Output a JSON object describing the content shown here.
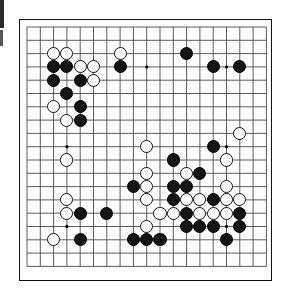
{
  "app": {
    "title": "Go Board Position",
    "board_size": 19,
    "colors": {
      "line": "#4a4a4a",
      "frame": "#111111",
      "black_stone": "#141414",
      "white_stone": "#ffffff",
      "white_stone_border": "#111111",
      "background": "#ffffff"
    }
  },
  "board": {
    "size": 19,
    "origin_x": 8.0,
    "origin_y": 8.0,
    "cell": 13.3,
    "stone_radius": 6.6,
    "star_points": [
      {
        "col": 4,
        "row": 4
      },
      {
        "col": 10,
        "row": 4
      },
      {
        "col": 16,
        "row": 4
      },
      {
        "col": 4,
        "row": 10
      },
      {
        "col": 10,
        "row": 10
      },
      {
        "col": 16,
        "row": 10
      },
      {
        "col": 4,
        "row": 16
      },
      {
        "col": 10,
        "row": 16
      },
      {
        "col": 16,
        "row": 16
      }
    ],
    "stones": [
      {
        "color": "white",
        "col": 3,
        "row": 3
      },
      {
        "color": "white",
        "col": 4,
        "row": 3
      },
      {
        "color": "white",
        "col": 8,
        "row": 3
      },
      {
        "color": "black",
        "col": 13,
        "row": 3
      },
      {
        "color": "black",
        "col": 3,
        "row": 4
      },
      {
        "color": "black",
        "col": 4,
        "row": 4
      },
      {
        "color": "white",
        "col": 5,
        "row": 4
      },
      {
        "color": "white",
        "col": 6,
        "row": 4
      },
      {
        "color": "black",
        "col": 8,
        "row": 4
      },
      {
        "color": "black",
        "col": 15,
        "row": 4
      },
      {
        "color": "black",
        "col": 17,
        "row": 4
      },
      {
        "color": "black",
        "col": 3,
        "row": 5
      },
      {
        "color": "black",
        "col": 5,
        "row": 5
      },
      {
        "color": "white",
        "col": 6,
        "row": 5
      },
      {
        "color": "black",
        "col": 4,
        "row": 6
      },
      {
        "color": "white",
        "col": 3,
        "row": 7
      },
      {
        "color": "black",
        "col": 5,
        "row": 7
      },
      {
        "color": "white",
        "col": 4,
        "row": 8
      },
      {
        "color": "black",
        "col": 5,
        "row": 8
      },
      {
        "color": "white",
        "col": 17,
        "row": 9
      },
      {
        "color": "white",
        "col": 10,
        "row": 10
      },
      {
        "color": "black",
        "col": 15,
        "row": 10
      },
      {
        "color": "white",
        "col": 4,
        "row": 11
      },
      {
        "color": "black",
        "col": 12,
        "row": 11
      },
      {
        "color": "white",
        "col": 16,
        "row": 11
      },
      {
        "color": "white",
        "col": 10,
        "row": 12
      },
      {
        "color": "white",
        "col": 13,
        "row": 12
      },
      {
        "color": "black",
        "col": 14,
        "row": 12
      },
      {
        "color": "black",
        "col": 9,
        "row": 13
      },
      {
        "color": "white",
        "col": 10,
        "row": 13
      },
      {
        "color": "black",
        "col": 12,
        "row": 13
      },
      {
        "color": "black",
        "col": 13,
        "row": 13
      },
      {
        "color": "white",
        "col": 16,
        "row": 13
      },
      {
        "color": "white",
        "col": 4,
        "row": 14
      },
      {
        "color": "white",
        "col": 10,
        "row": 14
      },
      {
        "color": "black",
        "col": 12,
        "row": 14
      },
      {
        "color": "white",
        "col": 13,
        "row": 14
      },
      {
        "color": "white",
        "col": 14,
        "row": 14
      },
      {
        "color": "black",
        "col": 15,
        "row": 14
      },
      {
        "color": "white",
        "col": 16,
        "row": 14
      },
      {
        "color": "white",
        "col": 17,
        "row": 14
      },
      {
        "color": "white",
        "col": 4,
        "row": 15
      },
      {
        "color": "black",
        "col": 5,
        "row": 15
      },
      {
        "color": "black",
        "col": 7,
        "row": 15
      },
      {
        "color": "white",
        "col": 11,
        "row": 15
      },
      {
        "color": "white",
        "col": 12,
        "row": 15
      },
      {
        "color": "black",
        "col": 13,
        "row": 15
      },
      {
        "color": "white",
        "col": 14,
        "row": 15
      },
      {
        "color": "white",
        "col": 15,
        "row": 15
      },
      {
        "color": "white",
        "col": 16,
        "row": 15
      },
      {
        "color": "black",
        "col": 17,
        "row": 15
      },
      {
        "color": "white",
        "col": 10,
        "row": 16
      },
      {
        "color": "black",
        "col": 13,
        "row": 16
      },
      {
        "color": "black",
        "col": 14,
        "row": 16
      },
      {
        "color": "black",
        "col": 15,
        "row": 16
      },
      {
        "color": "black",
        "col": 17,
        "row": 16
      },
      {
        "color": "white",
        "col": 3,
        "row": 17
      },
      {
        "color": "black",
        "col": 5,
        "row": 17
      },
      {
        "color": "black",
        "col": 9,
        "row": 17
      },
      {
        "color": "black",
        "col": 10,
        "row": 17
      },
      {
        "color": "black",
        "col": 11,
        "row": 17
      },
      {
        "color": "black",
        "col": 16,
        "row": 17
      }
    ]
  },
  "stats": {
    "black_count": 33,
    "white_count": 29,
    "total_count": 62
  }
}
